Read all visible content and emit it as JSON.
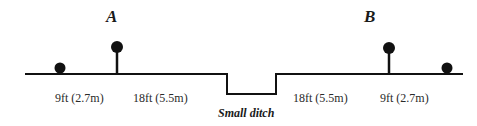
{
  "diagram": {
    "markers": {
      "a": "A",
      "b": "B"
    },
    "distances": {
      "left_outer": "9ft (2.7m)",
      "left_inner": "18ft (5.5m)",
      "right_inner": "18ft (5.5m)",
      "right_outer": "9ft (2.7m)"
    },
    "ditch_label": "Small ditch",
    "colors": {
      "line": "#111111",
      "text": "#2a2a2a"
    }
  }
}
